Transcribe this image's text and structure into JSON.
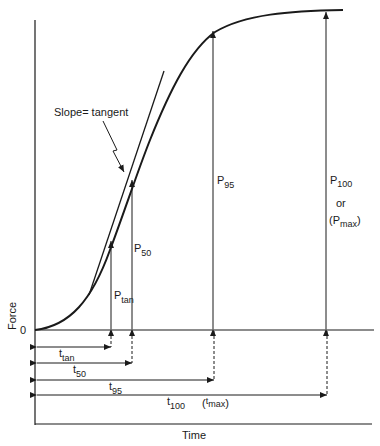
{
  "diagram": {
    "x_axis_label": "Time",
    "y_axis_label": "Force",
    "origin_label": "0",
    "annotation": "Slope= tangent",
    "force_markers": [
      {
        "id": "p_tan",
        "main": "P",
        "sub": "tan"
      },
      {
        "id": "p_50",
        "main": "P",
        "sub": "50"
      },
      {
        "id": "p_95",
        "main": "P",
        "sub": "95"
      },
      {
        "id": "p_100",
        "main": "P",
        "sub": "100",
        "line2": "or",
        "line3_open": "(P",
        "line3_sub": "max",
        "line3_close": ")"
      }
    ],
    "time_markers": [
      {
        "id": "t_tan",
        "main": "t",
        "sub": "tan"
      },
      {
        "id": "t_50",
        "main": "t",
        "sub": "50"
      },
      {
        "id": "t_95",
        "main": "t",
        "sub": "95"
      },
      {
        "id": "t_100",
        "main": "t",
        "sub": "100",
        "alt_open": "(",
        "alt_main": "t",
        "alt_sub": "max",
        "alt_close": ")"
      }
    ],
    "colors": {
      "ink": "#1a1a1a",
      "background": "#ffffff"
    }
  }
}
